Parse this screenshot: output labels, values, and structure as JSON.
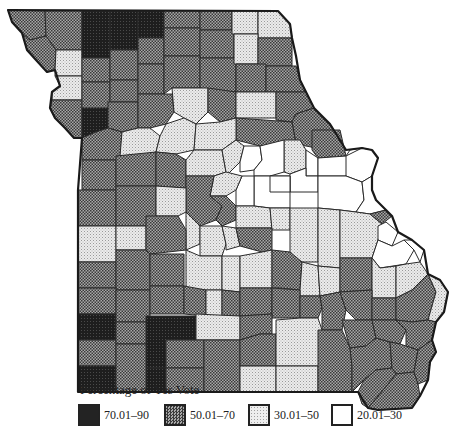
{
  "map": {
    "region": "Missouri counties",
    "fill_classes": {
      "c70": {
        "label": "70.01–90",
        "color": "#262626",
        "pattern": "dark-dense"
      },
      "c50": {
        "label": "50.01–70",
        "color": "#8a8a8a",
        "pattern": "checker"
      },
      "c30": {
        "label": "30.01–50",
        "color": "#dcdcdc",
        "pattern": "light-stipple"
      },
      "c20": {
        "label": "20.01–30",
        "color": "#ffffff",
        "pattern": "none"
      }
    },
    "border_color": "#222222"
  },
  "legend": {
    "title": "Percentage of Yes Vote",
    "items": [
      {
        "label": "70.01–90",
        "class": "c70"
      },
      {
        "label": "50.01–70",
        "class": "c50"
      },
      {
        "label": "30.01–50",
        "class": "c30"
      },
      {
        "label": "20.01–30",
        "class": "c20"
      }
    ]
  }
}
